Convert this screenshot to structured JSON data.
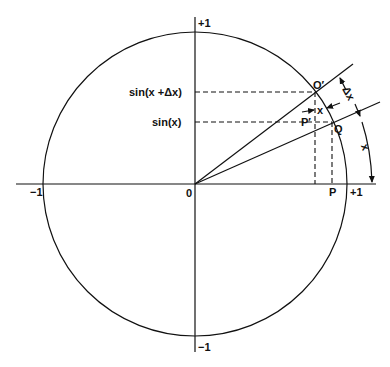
{
  "diagram": {
    "axes": {
      "x_pos_label": "+1",
      "x_neg_label": "−1",
      "y_pos_label": "+1",
      "y_neg_label": "−1",
      "origin_label": "0"
    },
    "labels": {
      "sin_x_dx": "sin(x +Δx)",
      "sin_x": "sin(x)",
      "point_q_prime": "O′",
      "point_q": "Q",
      "point_p_prime": "P′",
      "point_p": "P",
      "small_angle": "x",
      "delta_x": "Δx",
      "arc_x": "x"
    },
    "colors": {
      "ink": "#111111",
      "background": "#ffffff"
    }
  }
}
